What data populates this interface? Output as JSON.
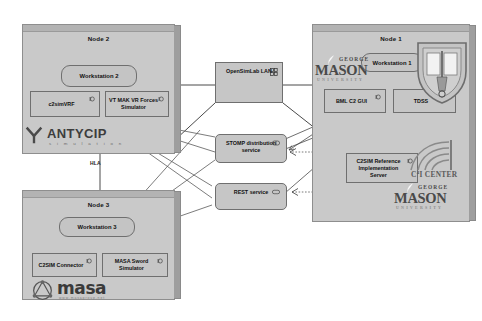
{
  "diagram": {
    "background_color": "#ffffff",
    "panel_color": "#c9c9c9",
    "box_color": "#c6c6c6",
    "line_color": "#4a4a4a"
  },
  "nodes": [
    {
      "id": "node2",
      "title": "Node 2",
      "workstation": "Workstation 2",
      "components": [
        {
          "label": "c2simVRF",
          "icon": "component-icon"
        },
        {
          "label": "VT MAK VR Forces Simulator",
          "icon": "component-icon"
        }
      ],
      "logo": {
        "name": "antycip-logo",
        "main": "ANTYCIP",
        "sub": "s i m u l a t i o n"
      }
    },
    {
      "id": "node3",
      "title": "Node 3",
      "workstation": "Workstation 3",
      "components": [
        {
          "label": "C2SIM Connector",
          "icon": "component-icon"
        },
        {
          "label": "MASA Sword Simulator",
          "icon": "component-icon"
        }
      ],
      "logo": {
        "name": "masa-logo",
        "main": "masa",
        "sub": "www.masagroup.net"
      }
    },
    {
      "id": "node1",
      "title": "Node 1",
      "workstation": "Workstation 1",
      "components": [
        {
          "label": "BML C2 GUI",
          "icon": "component-icon"
        },
        {
          "label": "TDSS",
          "icon": "component-icon"
        },
        {
          "label": "C2SIM Reference Implementation Server",
          "icon": "component-icon"
        }
      ],
      "logos": [
        {
          "name": "gmu-logo-top",
          "george": "GEORGE",
          "mason": "MASON",
          "university": "UNIVERSITY"
        },
        {
          "name": "gmu-logo-bottom",
          "george": "GEORGE",
          "mason": "MASON",
          "university": "UNIVERSITY"
        },
        {
          "name": "gmu-shield-emblem"
        },
        {
          "name": "c4i-center-logo",
          "text": "C",
          "sup": "4",
          "rest": "I CENTER"
        }
      ]
    }
  ],
  "network": {
    "lan": {
      "label": "OpenSimLab LAN",
      "icon": "network-icon"
    },
    "services": [
      {
        "id": "stomp",
        "label": "STOMP distribution service",
        "icon": "interface-icon"
      },
      {
        "id": "rest",
        "label": "REST service",
        "icon": "interface-icon"
      }
    ]
  },
  "connections": {
    "hla_label": "HLA"
  }
}
